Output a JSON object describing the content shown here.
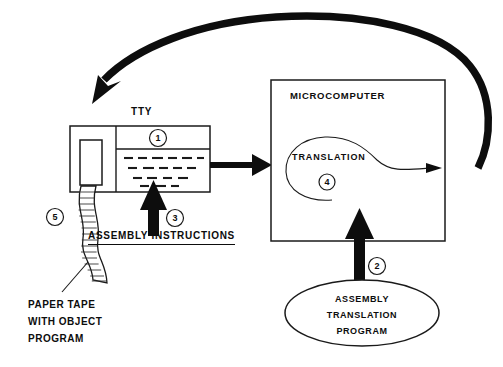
{
  "diagram": {
    "background_color": "#ffffff",
    "ink_color": "#0d0d0d",
    "labels": {
      "tty": "TTY",
      "microcomputer": "MICROCOMPUTER",
      "translation": "TRANSLATION",
      "assembly_instructions": "ASSEMBLY INSTRUCTIONS",
      "paper_tape_line1": "PAPER TAPE",
      "paper_tape_line2": "WITH OBJECT",
      "paper_tape_line3": "PROGRAM",
      "ellipse_line1": "ASSEMBLY",
      "ellipse_line2": "TRANSLATION",
      "ellipse_line3": "PROGRAM"
    },
    "step_markers": {
      "one": "1",
      "two": "2",
      "three": "3",
      "four": "4",
      "five": "5"
    }
  }
}
